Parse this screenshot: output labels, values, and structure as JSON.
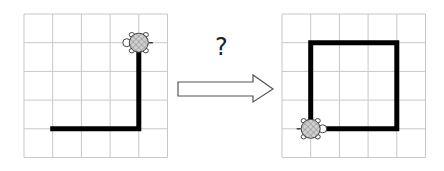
{
  "question_mark": "?",
  "grid": {
    "cols": 5,
    "rows": 5,
    "cell": 28.7,
    "line_color": "#c8c8c8"
  },
  "colors": {
    "path": "#000000",
    "shell": "#d0d0d0",
    "outline": "#333333"
  },
  "before": {
    "origin": [
      24,
      14
    ],
    "path": [
      [
        1,
        4
      ],
      [
        4,
        4
      ],
      [
        4,
        1
      ]
    ],
    "turtle": {
      "at": [
        4,
        1
      ],
      "heading": "up"
    }
  },
  "after": {
    "origin": [
      282,
      14
    ],
    "path": [
      [
        1,
        4
      ],
      [
        1,
        1
      ],
      [
        4,
        1
      ],
      [
        4,
        4
      ],
      [
        1,
        4
      ]
    ],
    "turtle": {
      "at": [
        1,
        4
      ],
      "heading": "right"
    }
  },
  "arrow": {
    "from_x": 178,
    "to_x": 273,
    "y": 89
  }
}
